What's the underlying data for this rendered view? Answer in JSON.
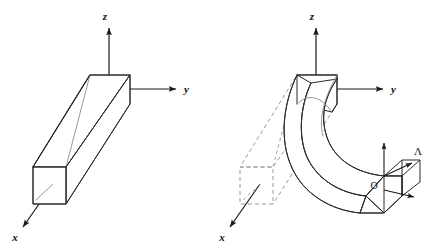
{
  "figure": {
    "background_color": "#ffffff",
    "line_color": "#2b2b2b",
    "hidden_line_color": "#8c8c8c",
    "ghost_line_color": "#9a9a9a",
    "width_px": 434,
    "height_px": 251
  },
  "panels": [
    {
      "id": "left",
      "name": "undeformed-beam",
      "description": "straight prismatic cantilever beam drawn in axonometric projection",
      "axes": [
        {
          "key": "z",
          "label": "z",
          "direction": "up"
        },
        {
          "key": "y",
          "label": "y",
          "direction": "right"
        },
        {
          "key": "x",
          "label": "x",
          "direction": "down-left"
        }
      ]
    },
    {
      "id": "right",
      "name": "deformed-beam",
      "description": "beam bent into a curved arc with dashed ghost outline of the original straight beam",
      "axes": [
        {
          "key": "z",
          "label": "z",
          "direction": "up"
        },
        {
          "key": "y",
          "label": "y",
          "direction": "right"
        },
        {
          "key": "x",
          "label": "x",
          "direction": "down-left"
        }
      ],
      "origin_label": "O",
      "triad_label": "Λ",
      "triad_arrow_count": 3
    }
  ],
  "labels": {
    "left_z": "z",
    "left_y": "y",
    "left_x": "x",
    "right_z": "z",
    "right_y": "y",
    "right_x": "x",
    "origin": "O",
    "lambda": "Λ"
  }
}
